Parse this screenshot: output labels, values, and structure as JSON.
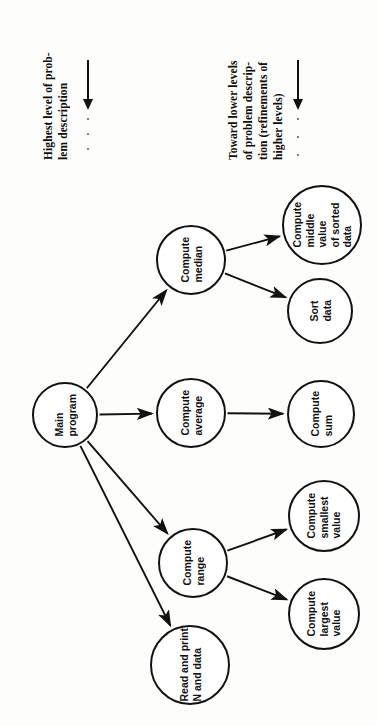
{
  "figure": {
    "orientation": "rotated-90-ccw",
    "ink_color": "#111111",
    "background_color": "#fdfdfb"
  },
  "legend": {
    "items": [
      {
        "id": "highest-level",
        "text": "Highest level of prob-\nlem description",
        "arrow": "arrow-right",
        "dots": 3
      },
      {
        "id": "lower-levels",
        "text": "Toward lower levels\nof problem descrip-\ntion (refinements of\nhigher levels)",
        "arrow": "arrow-right",
        "dots": 3
      }
    ]
  },
  "chart_data": {
    "type": "diagram",
    "subtype": "hierarchy-tree",
    "nodes": [
      {
        "id": "main-program",
        "label": "Main\nprogram",
        "level": 0,
        "cx": 65,
        "cy": 255,
        "r": 33
      },
      {
        "id": "compute-median",
        "label": "Compute\nmedian",
        "level": 1,
        "cx": 191,
        "cy": 100,
        "r": 35
      },
      {
        "id": "compute-average",
        "label": "Compute\naverage",
        "level": 1,
        "cx": 191,
        "cy": 253,
        "r": 35
      },
      {
        "id": "compute-range",
        "label": "Compute\nrange",
        "level": 1,
        "cx": 193,
        "cy": 403,
        "r": 35
      },
      {
        "id": "read-and-print",
        "label": "Read and print\nN and data",
        "level": 1,
        "cx": 190,
        "cy": 505,
        "r": 40
      },
      {
        "id": "compute-middle-value",
        "label": "Compute\nmiddle\nvalue\nof sorted\ndata",
        "level": 2,
        "cx": 322,
        "cy": 65,
        "r": 40
      },
      {
        "id": "sort-data",
        "label": "Sort\ndata",
        "level": 2,
        "cx": 320,
        "cy": 151,
        "r": 33
      },
      {
        "id": "compute-sum",
        "label": "Compute\nsum",
        "level": 2,
        "cx": 321,
        "cy": 254,
        "r": 34
      },
      {
        "id": "compute-smallest-value",
        "label": "Compute\nsmallest\nvalue",
        "level": 2,
        "cx": 324,
        "cy": 356,
        "r": 36
      },
      {
        "id": "compute-largest-value",
        "label": "Compute\nlargest\nvalue",
        "level": 2,
        "cx": 324,
        "cy": 454,
        "r": 36
      }
    ],
    "edges": [
      {
        "from": "main-program",
        "to": "compute-median"
      },
      {
        "from": "main-program",
        "to": "compute-average"
      },
      {
        "from": "main-program",
        "to": "compute-range"
      },
      {
        "from": "main-program",
        "to": "read-and-print"
      },
      {
        "from": "compute-median",
        "to": "compute-middle-value"
      },
      {
        "from": "compute-median",
        "to": "sort-data"
      },
      {
        "from": "compute-average",
        "to": "compute-sum"
      },
      {
        "from": "compute-range",
        "to": "compute-smallest-value"
      },
      {
        "from": "compute-range",
        "to": "compute-largest-value"
      }
    ]
  }
}
